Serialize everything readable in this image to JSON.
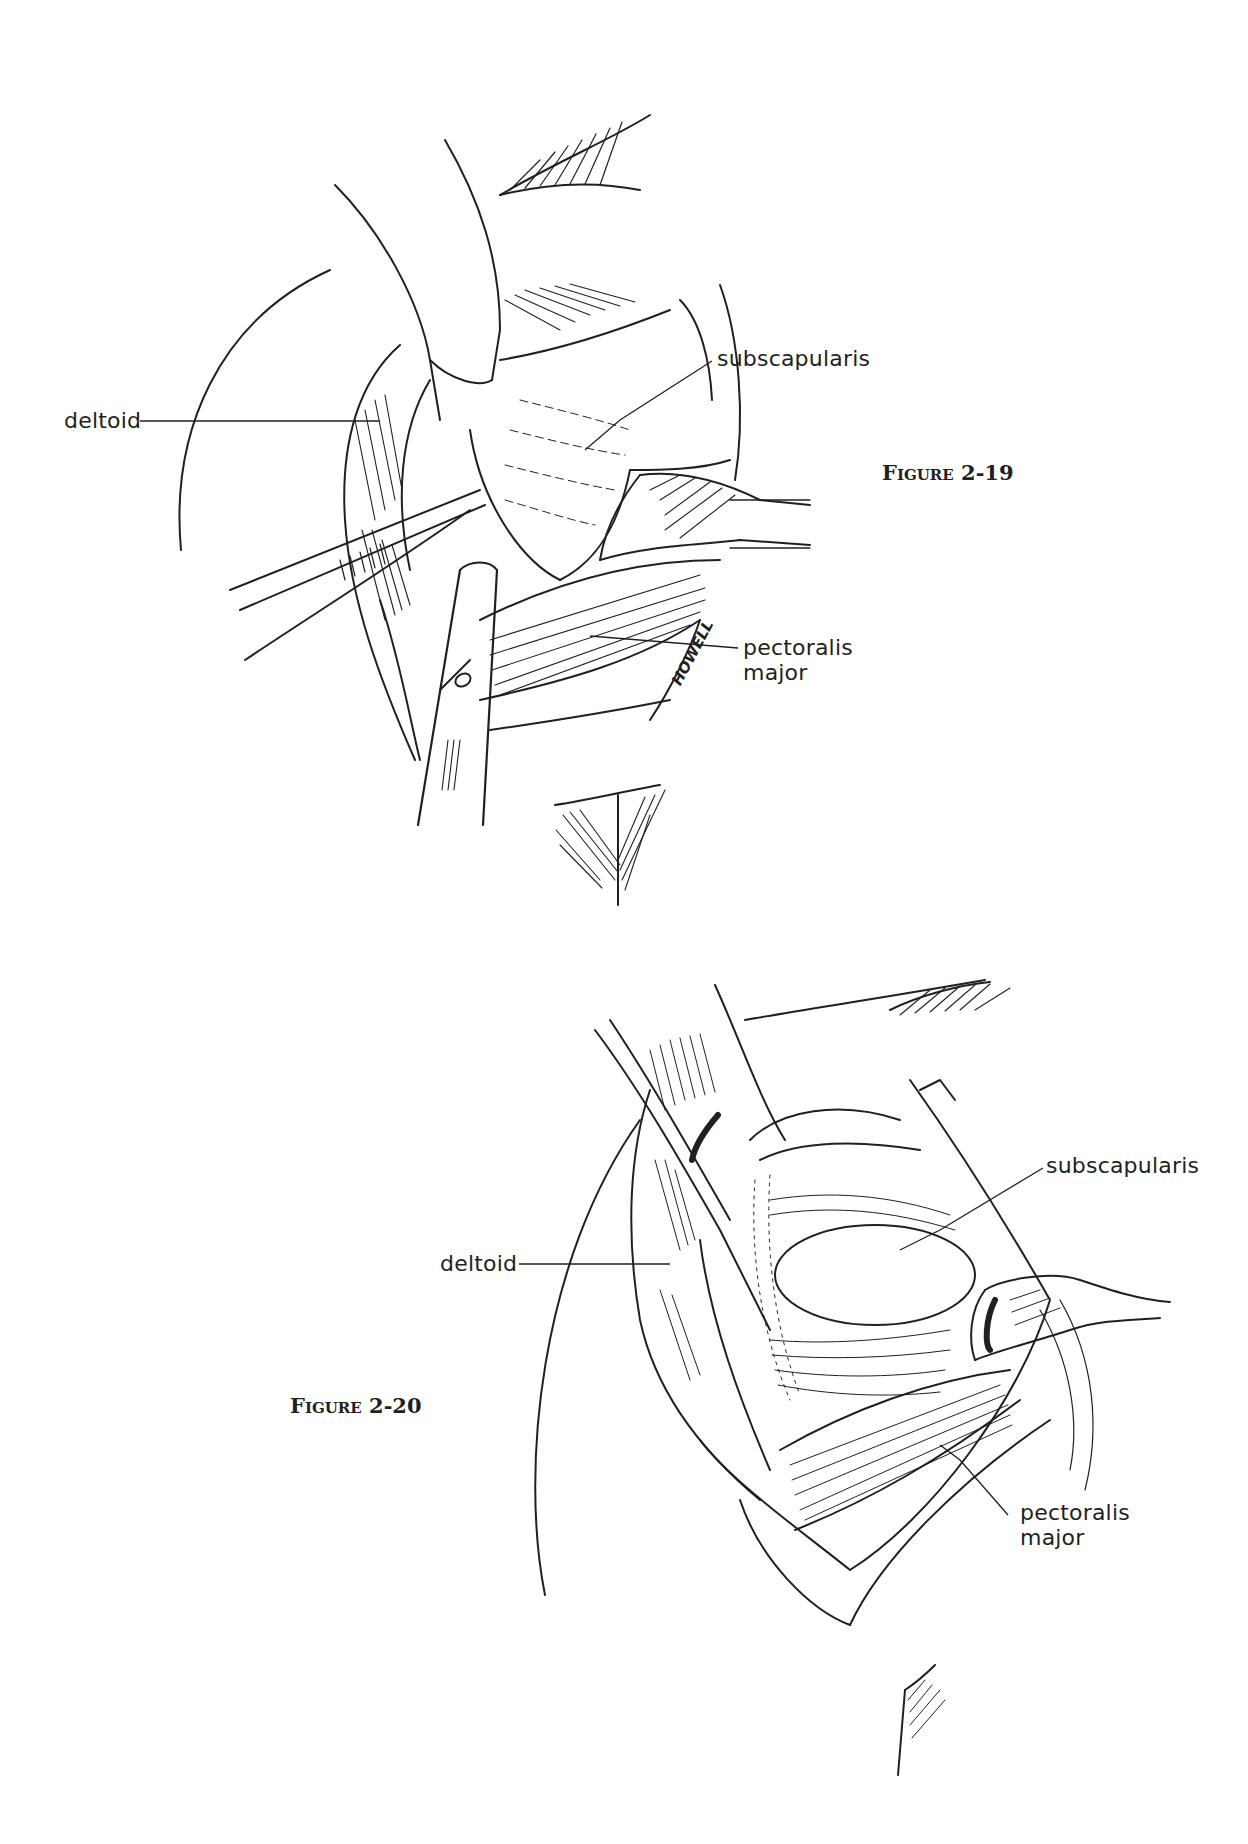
{
  "figures": [
    {
      "id": "figure-2-19",
      "caption": "Figure 2-19",
      "labels": {
        "deltoid": "deltoid",
        "subscapularis": "subscapularis",
        "pectoralis_line1": "pectoralis",
        "pectoralis_line2": "major"
      },
      "signature": "HOWELL"
    },
    {
      "id": "figure-2-20",
      "caption": "Figure 2-20",
      "labels": {
        "deltoid": "deltoid",
        "subscapularis": "subscapularis",
        "pectoralis_line1": "pectoralis",
        "pectoralis_line2": "major"
      }
    }
  ],
  "colors": {
    "ink": "#231f20",
    "paper": "#ffffff"
  }
}
